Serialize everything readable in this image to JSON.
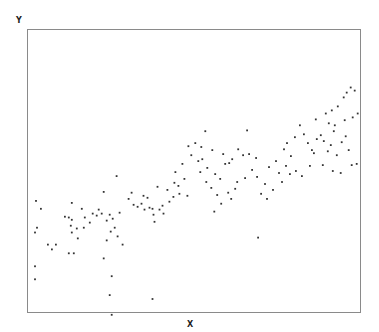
{
  "chart_data": {
    "type": "scatter",
    "title": "",
    "xlabel": "X",
    "ylabel": "Y",
    "xlim": [
      0,
      100
    ],
    "ylim": [
      0,
      100
    ],
    "grid": false,
    "legend": null,
    "axis_ticks": "none shown",
    "marker_color": "#333333",
    "frame_color": "#888888",
    "points": [
      [
        2.4,
        39.4
      ],
      [
        3.9,
        36.6
      ],
      [
        2.7,
        29.9
      ],
      [
        2.1,
        28.2
      ],
      [
        6.0,
        23.9
      ],
      [
        7.2,
        22.2
      ],
      [
        8.4,
        23.9
      ],
      [
        12.9,
        30.6
      ],
      [
        12.3,
        20.8
      ],
      [
        13.8,
        20.8
      ],
      [
        11.1,
        33.8
      ],
      [
        12.3,
        33.5
      ],
      [
        13.2,
        32.7
      ],
      [
        13.2,
        28.2
      ],
      [
        14.7,
        29.6
      ],
      [
        15.0,
        26.1
      ],
      [
        13.2,
        38.7
      ],
      [
        2.1,
        16.2
      ],
      [
        2.1,
        11.6
      ],
      [
        25.2,
        12.7
      ],
      [
        17.1,
        33.5
      ],
      [
        19.5,
        34.9
      ],
      [
        20.7,
        34.2
      ],
      [
        21.3,
        36.3
      ],
      [
        22.2,
        34.9
      ],
      [
        23.7,
        32.4
      ],
      [
        24.6,
        34.5
      ],
      [
        25.5,
        33.1
      ],
      [
        22.8,
        42.6
      ],
      [
        26.7,
        48.2
      ],
      [
        27.6,
        35.2
      ],
      [
        26.1,
        29.9
      ],
      [
        24.9,
        28.5
      ],
      [
        27.0,
        26.8
      ],
      [
        28.5,
        23.9
      ],
      [
        23.7,
        25.4
      ],
      [
        22.8,
        19.0
      ],
      [
        18.6,
        31.7
      ],
      [
        16.8,
        29.9
      ],
      [
        16.2,
        36.6
      ],
      [
        33.0,
        37.3
      ],
      [
        34.2,
        38.4
      ],
      [
        36.0,
        40.5
      ],
      [
        35.1,
        36.3
      ],
      [
        37.5,
        36.6
      ],
      [
        39.6,
        36.3
      ],
      [
        38.1,
        32.0
      ],
      [
        40.5,
        37.7
      ],
      [
        42.6,
        39.1
      ],
      [
        43.8,
        40.8
      ],
      [
        45.6,
        41.9
      ],
      [
        39.0,
        44.4
      ],
      [
        44.4,
        49.6
      ],
      [
        46.5,
        52.5
      ],
      [
        49.2,
        55.6
      ],
      [
        48.3,
        58.8
      ],
      [
        50.4,
        59.9
      ],
      [
        53.4,
        64.1
      ],
      [
        52.2,
        58.5
      ],
      [
        55.5,
        57.4
      ],
      [
        51.3,
        53.5
      ],
      [
        52.5,
        54.2
      ],
      [
        54.0,
        51.1
      ],
      [
        51.9,
        49.6
      ],
      [
        53.7,
        46.1
      ],
      [
        56.4,
        48.9
      ],
      [
        57.9,
        47.2
      ],
      [
        55.2,
        44.0
      ],
      [
        57.0,
        41.5
      ],
      [
        60.3,
        42.3
      ],
      [
        62.4,
        43.7
      ],
      [
        61.2,
        40.1
      ],
      [
        58.2,
        38.4
      ],
      [
        56.1,
        35.6
      ],
      [
        48.0,
        41.2
      ],
      [
        45.3,
        44.7
      ],
      [
        59.4,
        52.5
      ],
      [
        61.5,
        54.2
      ],
      [
        63.3,
        57.7
      ],
      [
        64.8,
        55.6
      ],
      [
        66.6,
        56.0
      ],
      [
        66.0,
        64.4
      ],
      [
        69.0,
        47.9
      ],
      [
        71.4,
        45.4
      ],
      [
        70.2,
        41.9
      ],
      [
        72.0,
        40.1
      ],
      [
        73.8,
        43.3
      ],
      [
        72.6,
        51.4
      ],
      [
        74.7,
        53.5
      ],
      [
        75.6,
        49.3
      ],
      [
        77.1,
        57.7
      ],
      [
        78.0,
        59.9
      ],
      [
        77.7,
        51.8
      ],
      [
        79.2,
        55.3
      ],
      [
        80.4,
        62.0
      ],
      [
        81.9,
        66.2
      ],
      [
        83.1,
        63.0
      ],
      [
        84.3,
        59.9
      ],
      [
        85.5,
        57.4
      ],
      [
        86.1,
        56.3
      ],
      [
        87.0,
        61.3
      ],
      [
        88.2,
        62.7
      ],
      [
        89.1,
        60.6
      ],
      [
        90.3,
        57.0
      ],
      [
        91.2,
        59.2
      ],
      [
        92.1,
        64.1
      ],
      [
        93.0,
        55.6
      ],
      [
        94.5,
        60.2
      ],
      [
        95.7,
        62.3
      ],
      [
        96.6,
        57.4
      ],
      [
        76.5,
        46.1
      ],
      [
        78.9,
        48.9
      ],
      [
        80.7,
        50.0
      ],
      [
        82.5,
        48.2
      ],
      [
        84.9,
        51.8
      ],
      [
        88.8,
        52.1
      ],
      [
        91.8,
        50.0
      ],
      [
        94.2,
        49.3
      ],
      [
        97.5,
        52.1
      ],
      [
        99.0,
        52.5
      ],
      [
        86.7,
        68.3
      ],
      [
        89.7,
        70.4
      ],
      [
        91.5,
        71.5
      ],
      [
        93.3,
        72.9
      ],
      [
        90.6,
        66.9
      ],
      [
        96.0,
        77.8
      ],
      [
        97.2,
        79.6
      ],
      [
        98.4,
        78.5
      ],
      [
        95.1,
        76.1
      ],
      [
        99.3,
        70.4
      ],
      [
        97.8,
        69.0
      ],
      [
        95.4,
        68.0
      ],
      [
        92.4,
        66.2
      ],
      [
        63.0,
        46.1
      ],
      [
        65.4,
        47.5
      ],
      [
        67.5,
        50.4
      ],
      [
        68.7,
        54.6
      ],
      [
        60.6,
        52.8
      ],
      [
        58.8,
        56.0
      ],
      [
        47.1,
        47.2
      ],
      [
        44.1,
        45.8
      ],
      [
        42.0,
        43.3
      ],
      [
        40.8,
        34.9
      ],
      [
        37.8,
        34.5
      ],
      [
        36.6,
        37.0
      ],
      [
        34.8,
        41.2
      ],
      [
        31.8,
        38.0
      ],
      [
        30.3,
        40.1
      ],
      [
        31.2,
        42.3
      ],
      [
        69.3,
        26.4
      ],
      [
        24.6,
        6.0
      ],
      [
        37.5,
        4.6
      ],
      [
        25.2,
        -1.0
      ]
    ]
  }
}
